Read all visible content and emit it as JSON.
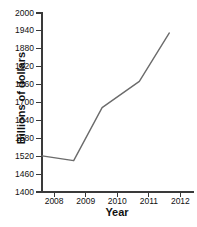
{
  "chart_data": {
    "type": "line",
    "title": "",
    "xlabel": "Year",
    "ylabel": "Billions of dollars",
    "x": [
      2008,
      2009,
      2010,
      2011,
      2012
    ],
    "xtick_labels": [
      "2008",
      "2009",
      "2010",
      "2011",
      "2012"
    ],
    "ytick_labels": [
      "1400",
      "1460",
      "1520",
      "1580",
      "1640",
      "1700",
      "1760",
      "1820",
      "1880",
      "1940",
      "2000"
    ],
    "ytick_values": [
      1400,
      1460,
      1520,
      1580,
      1640,
      1700,
      1760,
      1820,
      1880,
      1940,
      2000
    ],
    "xlim": [
      2007.6,
      2012.4
    ],
    "ylim": [
      1400,
      2000
    ],
    "grid": false,
    "legend": false,
    "series": [
      {
        "name": "Billions of dollars",
        "color": "#6b6b6b",
        "values": [
          1521,
          1505,
          1683,
          1771,
          1933
        ],
        "points": [
          {
            "x": 2007.62,
            "y": 1521
          },
          {
            "x": 2008.62,
            "y": 1505
          },
          {
            "x": 2009.52,
            "y": 1683
          },
          {
            "x": 2010.7,
            "y": 1771
          },
          {
            "x": 2011.65,
            "y": 1933
          }
        ]
      }
    ]
  },
  "axes": {
    "y_title": "Billions of dollars",
    "x_title": "Year",
    "y_ticks": [
      {
        "label": "2000",
        "value": 2000
      },
      {
        "label": "1940",
        "value": 1940
      },
      {
        "label": "1880",
        "value": 1880
      },
      {
        "label": "1820",
        "value": 1820
      },
      {
        "label": "1760",
        "value": 1760
      },
      {
        "label": "1700",
        "value": 1700
      },
      {
        "label": "1640",
        "value": 1640
      },
      {
        "label": "1580",
        "value": 1580
      },
      {
        "label": "1520",
        "value": 1520
      },
      {
        "label": "1460",
        "value": 1460
      },
      {
        "label": "1400",
        "value": 1400
      }
    ],
    "x_ticks": [
      {
        "label": "2008",
        "value": 2008
      },
      {
        "label": "2009",
        "value": 2009
      },
      {
        "label": "2010",
        "value": 2010
      },
      {
        "label": "2011",
        "value": 2011
      },
      {
        "label": "2012",
        "value": 2012
      }
    ]
  },
  "colors": {
    "line": "#6b6b6b",
    "axis": "#3a3a3a",
    "text": "#111111",
    "background": "#ffffff"
  }
}
